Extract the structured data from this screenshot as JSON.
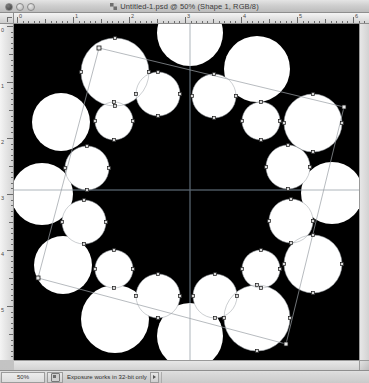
{
  "window": {
    "title": "Untitled-1.psd @ 50% (Shape 1, RGB/8)",
    "doc_icon": "photoshop-document-icon",
    "controls": {
      "close": "close-button",
      "minimize": "minimize-button",
      "maximize": "maximize-button"
    }
  },
  "rulers": {
    "unit": "px",
    "horizontal_labels": [
      "0",
      "1",
      "2",
      "3",
      "4",
      "5",
      "6"
    ],
    "vertical_labels": [
      "0",
      "1",
      "2",
      "3",
      "4",
      "5",
      "6"
    ]
  },
  "statusbar": {
    "zoom": "50%",
    "thumbnail_icon": "document-proxy-icon",
    "message": "Exposure works in 32-bit only",
    "popup_icon": "triangle-right-icon"
  },
  "canvas": {
    "background_color": "#000000",
    "shape_fill": "#ffffff",
    "path_stroke": "#9aa0a6",
    "guide_color": "#4a5560",
    "anchor_fill": "#d8d8d8",
    "anchor_stroke": "#1a1a1a",
    "guides": {
      "vertical_x": 176,
      "horizontal_y": 166
    },
    "bounding_box": {
      "corners": [
        [
          85,
          24
        ],
        [
          330,
          83
        ],
        [
          272,
          320
        ],
        [
          24,
          254
        ]
      ],
      "handle_size": 4
    },
    "circles": [
      {
        "cx": 176,
        "cy": 9,
        "r": 33,
        "anchors": false
      },
      {
        "cx": 101,
        "cy": 48,
        "r": 34,
        "anchors": true
      },
      {
        "cx": 243,
        "cy": 45,
        "r": 33,
        "anchors": false
      },
      {
        "cx": 144,
        "cy": 70,
        "r": 22,
        "anchors": true
      },
      {
        "cx": 200,
        "cy": 72,
        "r": 22,
        "anchors": true
      },
      {
        "cx": 47,
        "cy": 98,
        "r": 29,
        "anchors": false
      },
      {
        "cx": 100,
        "cy": 97,
        "r": 19,
        "anchors": true
      },
      {
        "cx": 247,
        "cy": 97,
        "r": 19,
        "anchors": true
      },
      {
        "cx": 299,
        "cy": 99,
        "r": 29,
        "anchors": true
      },
      {
        "cx": 73,
        "cy": 144,
        "r": 22,
        "anchors": true
      },
      {
        "cx": 274,
        "cy": 143,
        "r": 22,
        "anchors": true
      },
      {
        "cx": 28,
        "cy": 170,
        "r": 31,
        "anchors": false
      },
      {
        "cx": 318,
        "cy": 169,
        "r": 31,
        "anchors": false
      },
      {
        "cx": 70,
        "cy": 198,
        "r": 22,
        "anchors": true
      },
      {
        "cx": 277,
        "cy": 197,
        "r": 22,
        "anchors": true
      },
      {
        "cx": 49,
        "cy": 241,
        "r": 29,
        "anchors": false
      },
      {
        "cx": 100,
        "cy": 245,
        "r": 19,
        "anchors": true
      },
      {
        "cx": 247,
        "cy": 245,
        "r": 19,
        "anchors": true
      },
      {
        "cx": 299,
        "cy": 240,
        "r": 29,
        "anchors": true
      },
      {
        "cx": 144,
        "cy": 272,
        "r": 22,
        "anchors": true
      },
      {
        "cx": 201,
        "cy": 272,
        "r": 22,
        "anchors": true
      },
      {
        "cx": 101,
        "cy": 295,
        "r": 34,
        "anchors": false
      },
      {
        "cx": 243,
        "cy": 294,
        "r": 33,
        "anchors": true
      },
      {
        "cx": 176,
        "cy": 312,
        "r": 33,
        "anchors": false
      }
    ]
  }
}
